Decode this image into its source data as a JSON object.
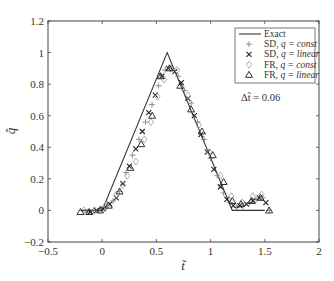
{
  "chart_data": {
    "type": "line",
    "title": "",
    "xlabel": "t̃",
    "ylabel": "q̂",
    "xlim": [
      -0.5,
      2
    ],
    "ylim": [
      -0.2,
      1.2
    ],
    "xticks": [
      "-0.5",
      "0",
      "0.5",
      "1",
      "1.5",
      "2"
    ],
    "yticks": [
      "-0.2",
      "0",
      "0.2",
      "0.4",
      "0.6",
      "0.8",
      "1",
      "1.2"
    ],
    "grid": false,
    "legend_position": "upper right",
    "annotation": "Δt̃ = 0.06",
    "series": [
      {
        "name": "Exact",
        "style": "line",
        "x": [
          -0.2,
          0.0,
          0.6,
          1.2,
          1.5
        ],
        "y": [
          0.0,
          0.0,
          1.0,
          0.0,
          0.0
        ]
      },
      {
        "name": "SD, q = const",
        "marker": "plus",
        "x": [
          -0.14,
          -0.08,
          -0.02,
          0.04,
          0.1,
          0.16,
          0.22,
          0.28,
          0.34,
          0.4,
          0.46,
          0.52,
          0.58,
          0.64,
          0.7,
          0.76,
          0.82,
          0.88,
          0.94,
          1.0,
          1.06,
          1.12,
          1.18,
          1.24,
          1.3,
          1.36,
          1.42,
          1.48,
          1.54
        ],
        "y": [
          -0.01,
          0.0,
          0.01,
          0.02,
          0.06,
          0.12,
          0.24,
          0.35,
          0.45,
          0.56,
          0.67,
          0.79,
          0.89,
          0.9,
          0.85,
          0.76,
          0.68,
          0.56,
          0.45,
          0.33,
          0.22,
          0.11,
          0.05,
          0.02,
          0.03,
          0.05,
          0.07,
          0.08,
          0.0
        ]
      },
      {
        "name": "SD, q = linear",
        "marker": "x",
        "x": [
          -0.11,
          -0.05,
          0.01,
          0.07,
          0.13,
          0.19,
          0.25,
          0.31,
          0.37,
          0.43,
          0.49,
          0.55,
          0.61,
          0.67,
          0.73,
          0.79,
          0.85,
          0.91,
          0.97,
          1.03,
          1.09,
          1.15,
          1.21,
          1.27,
          1.33,
          1.39,
          1.45,
          1.51
        ],
        "y": [
          -0.01,
          0.0,
          0.01,
          0.04,
          0.08,
          0.17,
          0.28,
          0.39,
          0.5,
          0.62,
          0.73,
          0.85,
          0.9,
          0.88,
          0.81,
          0.71,
          0.6,
          0.48,
          0.37,
          0.26,
          0.15,
          0.07,
          0.03,
          0.03,
          0.04,
          0.06,
          0.08,
          0.05
        ]
      },
      {
        "name": "FR, q = const",
        "marker": "diamond",
        "x": [
          -0.17,
          -0.07,
          0.03,
          0.13,
          0.19,
          0.23,
          0.31,
          0.39,
          0.45,
          0.51,
          0.57,
          0.63,
          0.69,
          0.79,
          0.89,
          0.99,
          1.09,
          1.19,
          1.29,
          1.39,
          1.47
        ],
        "y": [
          0.0,
          0.0,
          0.03,
          0.1,
          0.16,
          0.22,
          0.31,
          0.45,
          0.56,
          0.72,
          0.83,
          0.9,
          0.89,
          0.73,
          0.54,
          0.37,
          0.22,
          0.09,
          0.05,
          0.09,
          0.1
        ]
      },
      {
        "name": "FR, q = linear",
        "marker": "triangle",
        "x": [
          -0.2,
          -0.12,
          -0.02,
          0.06,
          0.16,
          0.26,
          0.36,
          0.46,
          0.54,
          0.62,
          0.72,
          0.82,
          0.92,
          1.02,
          1.12,
          1.2,
          1.28,
          1.38,
          1.46,
          1.54
        ],
        "y": [
          -0.01,
          -0.01,
          0.0,
          0.03,
          0.12,
          0.27,
          0.42,
          0.6,
          0.85,
          0.9,
          0.79,
          0.64,
          0.5,
          0.35,
          0.18,
          0.06,
          0.04,
          0.06,
          0.08,
          0.0
        ]
      }
    ]
  },
  "legend": {
    "items": [
      {
        "label_prefix": "Exact",
        "label_italic": "",
        "marker": "line"
      },
      {
        "label_prefix": "SD, ",
        "label_italic": "q = const",
        "marker": "+"
      },
      {
        "label_prefix": "SD, ",
        "label_italic": "q = linear",
        "marker": "×"
      },
      {
        "label_prefix": "FR, ",
        "label_italic": "q = const",
        "marker": "◇"
      },
      {
        "label_prefix": "FR, ",
        "label_italic": "q = linear",
        "marker": "△"
      }
    ]
  },
  "annotation": "Δt̃ = 0.06",
  "axes": {
    "xlabel": "t̃",
    "ylabel": "q̂"
  }
}
